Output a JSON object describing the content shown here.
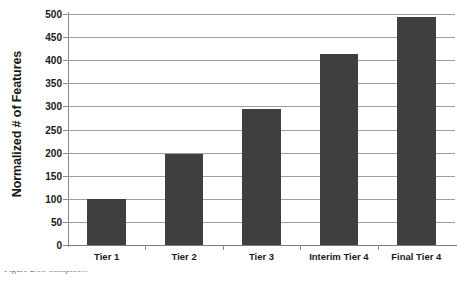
{
  "chart_data": {
    "type": "bar",
    "title": "",
    "xlabel": "",
    "ylabel": "Normalized # of Features",
    "categories": [
      "Tier 1",
      "Tier 2",
      "Tier 3",
      "Interim Tier 4",
      "Final Tier 4"
    ],
    "values": [
      100,
      197,
      295,
      413,
      493
    ],
    "ylim": [
      0,
      500
    ],
    "ytick_step": 50,
    "yticks": [
      0,
      50,
      100,
      150,
      200,
      250,
      300,
      350,
      400,
      450,
      500
    ],
    "ytick_labels": [
      "0",
      "50",
      "100",
      "150",
      "200",
      "250",
      "300",
      "350",
      "400",
      "450",
      "500"
    ],
    "grid": "horizontal",
    "legend": "none",
    "bar_color": "#3f3f3f",
    "gridline_color": "#9d9d9d",
    "background_color": "#ffffff"
  },
  "caption": {
    "text": "Figure 2.13   Complex..."
  }
}
